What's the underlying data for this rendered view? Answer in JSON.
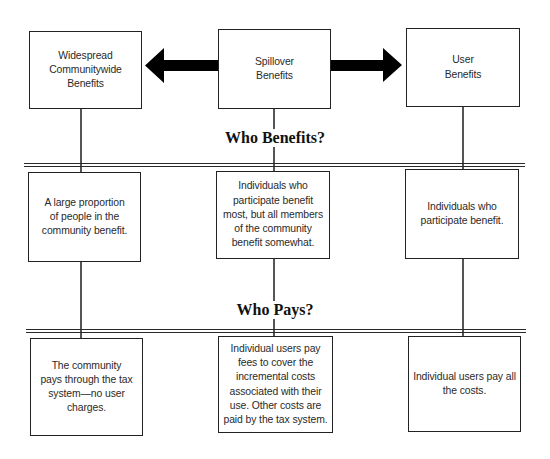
{
  "diagram": {
    "type": "benefit-spectrum",
    "colors": {
      "line": "#222222",
      "text": "#2a2a2a",
      "arrow": "#000000",
      "background": "#ffffff"
    },
    "arrows": [
      {
        "name": "arrow-left",
        "from": "Spillover Benefits",
        "to": "Widespread Communitywide Benefits"
      },
      {
        "name": "arrow-right",
        "from": "Spillover Benefits",
        "to": "User Benefits"
      }
    ],
    "sections": {
      "who_benefits": "Who Benefits?",
      "who_pays": "Who Pays?"
    },
    "columns": [
      {
        "category": [
          "Widespread",
          "Communitywide",
          "Benefits"
        ],
        "who_benefits": [
          "A large proportion",
          "of people in the",
          "community benefit."
        ],
        "who_pays": [
          "The community",
          "pays through the tax",
          "system—no user",
          "charges."
        ]
      },
      {
        "category": [
          "Spillover",
          "Benefits"
        ],
        "who_benefits": [
          "Individuals who",
          "participate benefit",
          "most, but all members",
          "of the community",
          "benefit somewhat."
        ],
        "who_pays": [
          "Individual users pay",
          "fees to cover the",
          "incremental costs",
          "associated with their",
          "use. Other costs are",
          "paid by the tax system."
        ]
      },
      {
        "category": [
          "User",
          "Benefits"
        ],
        "who_benefits": [
          "Individuals who",
          "participate benefit."
        ],
        "who_pays": [
          "Individual users pay all",
          "the costs."
        ]
      }
    ]
  }
}
